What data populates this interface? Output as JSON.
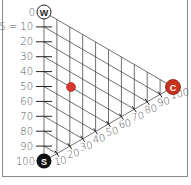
{
  "diagram": {
    "type": "ternary",
    "vertices": {
      "top": {
        "label": "W",
        "style": "outline"
      },
      "bottom": {
        "label": "S",
        "style": "filled-black"
      },
      "right": {
        "label": "C",
        "style": "filled-red"
      }
    },
    "left_axis": {
      "variable": "S",
      "ticks": [
        "0",
        "S = 10",
        "20",
        "30",
        "40",
        "50",
        "60",
        "70",
        "80",
        "90",
        "100"
      ]
    },
    "bottom_axis": {
      "variable": "C",
      "ticks": [
        "10",
        "20",
        "30",
        "40",
        "50",
        "60",
        "70",
        "80",
        "90",
        "100"
      ]
    },
    "point": {
      "S": 50,
      "C": 20,
      "W": 30,
      "color": "#d9372b"
    },
    "colors": {
      "grid": "#333333",
      "red": "#c8321f",
      "black": "#111111"
    }
  }
}
